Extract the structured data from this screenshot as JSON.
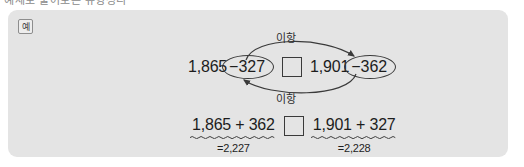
{
  "page": {
    "cutoff_text": "예제로 풀어보는 유형정리"
  },
  "panel": {
    "badge_label": "예",
    "accent_color": "#e4e4e4",
    "ink_color": "#1d1d1d"
  },
  "transposition_expression": {
    "label_top": "이항",
    "label_bottom": "이항",
    "left_number": "1,865",
    "left_term": "−327",
    "operator_blank": "",
    "right_number": "1,901",
    "right_term": "−362",
    "arrow_top_direction": "left-to-right",
    "arrow_bottom_direction": "right-to-left"
  },
  "comparison_expression": {
    "left_expr": "1,865 + 362",
    "left_result": "=2,227",
    "operator_blank": "",
    "right_expr": "1,901 + 327",
    "right_result": "=2,228"
  }
}
